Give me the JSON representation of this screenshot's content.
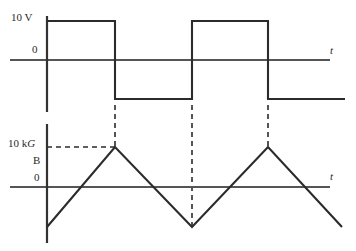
{
  "figure": {
    "title": "",
    "colors": {
      "axis": "#555555",
      "trace": "#2b2b2b",
      "dashed": "#2b2b2b",
      "background": "#ffffff",
      "text": "#2a2a2a"
    },
    "labels": {
      "voltage_amplitude": "10 V",
      "voltage_zero": "0",
      "time_axis_top": "t",
      "flux_amplitude_value": "10 k",
      "flux_amplitude_unit": "G",
      "flux_symbol": "B",
      "flux_zero": "0",
      "time_axis_bottom": "t"
    }
  },
  "chart_data": [
    {
      "type": "line",
      "name": "square-wave-voltage",
      "title": "",
      "xlabel": "t",
      "ylabel": "V",
      "tick_labels_y": [
        "10 V",
        "0"
      ],
      "grid": false,
      "legend": "none",
      "waveform": "square",
      "ylim": [
        -10,
        10
      ],
      "levels": {
        "high": 10,
        "zero": 0,
        "low": -10
      },
      "x": [
        47,
        115,
        115,
        192,
        192,
        268,
        268,
        345
      ],
      "y": [
        10,
        10,
        -10,
        -10,
        10,
        10,
        -10,
        -10
      ],
      "transitions_x": [
        115,
        192,
        268
      ],
      "y_axis_x": 47,
      "axis_y_pixel": 60,
      "high_y_pixel": 21,
      "low_y_pixel": 105
    },
    {
      "type": "line",
      "name": "triangle-wave-flux",
      "title": "",
      "xlabel": "t",
      "ylabel": "B",
      "tick_labels_y": [
        "10 kG",
        "0"
      ],
      "grid": false,
      "legend": "none",
      "waveform": "triangle",
      "ylim": [
        -10,
        10
      ],
      "levels": {
        "peak": 10,
        "zero": 0,
        "valley": -10
      },
      "x": [
        47,
        115,
        192,
        268,
        342
      ],
      "y": [
        -10,
        10,
        -10,
        10,
        -10
      ],
      "peaks_x": [
        115,
        268
      ],
      "valleys_x": [
        192
      ],
      "y_axis_x": 47,
      "axis_y_pixel": 187,
      "peak_y_pixel": 147,
      "valley_y_pixel": 230
    }
  ],
  "annotations": {
    "dashed_horizontal": {
      "label": "10 kG level guide",
      "from_x": 47,
      "to_x": 115,
      "y": 147
    },
    "dashed_verticals": [
      {
        "label": "transition-guide-1",
        "x": 115,
        "from_y": 105,
        "to_y": 147
      },
      {
        "label": "transition-guide-2",
        "x": 192,
        "from_y": 105,
        "to_y": 230
      },
      {
        "label": "transition-guide-3",
        "x": 268,
        "from_y": 105,
        "to_y": 147
      }
    ]
  }
}
